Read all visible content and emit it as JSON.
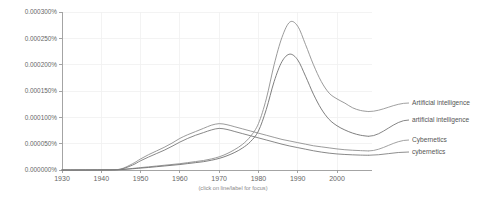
{
  "chart_data": {
    "type": "line",
    "title": "",
    "subtitle": "",
    "xlabel": "",
    "ylabel": "",
    "caption": "(click on line/label for focus)",
    "grid": true,
    "legend_position": "right-inline",
    "xlim": [
      1930,
      2008
    ],
    "ylim": [
      0.0,
      0.0003
    ],
    "x_ticks": [
      1930,
      1940,
      1950,
      1960,
      1970,
      1980,
      1990,
      2000
    ],
    "x_tick_labels": [
      "1930",
      "1940",
      "1950",
      "1960",
      "1970",
      "1980",
      "1990",
      "2000"
    ],
    "y_ticks": [
      0.0,
      5e-05,
      0.0001,
      0.00015,
      0.0002,
      0.00025,
      0.0003
    ],
    "y_tick_labels": [
      "0.000000%",
      "0.000050%",
      "0.000100%",
      "0.000150%",
      "0.000200%",
      "0.000250%",
      "0.000300%"
    ],
    "x": [
      1930,
      1933,
      1936,
      1939,
      1942,
      1945,
      1948,
      1950,
      1952,
      1954,
      1956,
      1958,
      1960,
      1962,
      1964,
      1966,
      1968,
      1970,
      1972,
      1974,
      1976,
      1978,
      1980,
      1982,
      1984,
      1986,
      1988,
      1990,
      1992,
      1994,
      1996,
      1998,
      2000,
      2002,
      2004,
      2006,
      2008
    ],
    "series": [
      {
        "name": "Artificial intelligence",
        "color": "#8f8f8f",
        "values": [
          0.0,
          0.0,
          1e-07,
          2e-07,
          4e-07,
          1e-06,
          3e-06,
          4.5e-06,
          6e-06,
          7.5e-06,
          9e-06,
          1.05e-05,
          1.2e-05,
          1.4e-05,
          1.6e-05,
          1.8e-05,
          2.1e-05,
          2.5e-05,
          3.1e-05,
          3.9e-05,
          4.9e-05,
          6.4e-05,
          8.8e-05,
          0.000135,
          0.0002,
          0.000252,
          0.000281,
          0.000273,
          0.000238,
          0.0002,
          0.000168,
          0.000146,
          0.000135,
          0.000127,
          0.000118,
          0.000113,
          0.000111
        ]
      },
      {
        "name": "artificial intelligence",
        "color": "#707070",
        "values": [
          0.0,
          0.0,
          1e-07,
          2e-07,
          3e-07,
          8e-07,
          2.4e-06,
          3.6e-06,
          4.8e-06,
          6.2e-06,
          7.6e-06,
          9e-06,
          1.04e-05,
          1.22e-05,
          1.4e-05,
          1.58e-05,
          1.85e-05,
          2.2e-05,
          2.7e-05,
          3.35e-05,
          4.2e-05,
          5.4e-05,
          7.4e-05,
          0.000115,
          0.000168,
          0.000206,
          0.00022,
          0.000209,
          0.000178,
          0.000144,
          0.000116,
          9.6e-05,
          8.4e-05,
          7.6e-05,
          7e-05,
          6.6e-05,
          6.4e-05
        ]
      },
      {
        "name": "Cybernetics",
        "color": "#909090",
        "values": [
          0.0,
          0.0,
          0.0,
          0.0,
          2e-07,
          2e-06,
          1.2e-05,
          2.1e-05,
          2.9e-05,
          3.6e-05,
          4.3e-05,
          5.1e-05,
          6e-05,
          6.7e-05,
          7.3e-05,
          7.9e-05,
          8.5e-05,
          8.8e-05,
          8.6e-05,
          8.2e-05,
          7.8e-05,
          7.4e-05,
          7e-05,
          6.6e-05,
          6.2e-05,
          5.8e-05,
          5.5e-05,
          5.2e-05,
          4.9e-05,
          4.6e-05,
          4.4e-05,
          4.2e-05,
          4e-05,
          3.85e-05,
          3.75e-05,
          3.68e-05,
          3.62e-05
        ]
      },
      {
        "name": "cybernetics",
        "color": "#7a7a7a",
        "values": [
          0.0,
          0.0,
          0.0,
          0.0,
          1e-07,
          1.5e-06,
          9.5e-06,
          1.75e-05,
          2.45e-05,
          3.1e-05,
          3.75e-05,
          4.5e-05,
          5.3e-05,
          6e-05,
          6.6e-05,
          7.1e-05,
          7.6e-05,
          7.9e-05,
          7.7e-05,
          7.3e-05,
          6.9e-05,
          6.5e-05,
          6.1e-05,
          5.7e-05,
          5.3e-05,
          4.9e-05,
          4.55e-05,
          4.25e-05,
          3.95e-05,
          3.65e-05,
          3.4e-05,
          3.2e-05,
          3.05e-05,
          2.95e-05,
          2.88e-05,
          2.83e-05,
          2.8e-05
        ]
      }
    ],
    "legend_entries": [
      {
        "label": "Artificial intelligence",
        "color": "#8f8f8f"
      },
      {
        "label": "artificial intelligence",
        "color": "#707070"
      },
      {
        "label": "Cybernetics",
        "color": "#909090"
      },
      {
        "label": "cybernetics",
        "color": "#7a7a7a"
      }
    ]
  }
}
